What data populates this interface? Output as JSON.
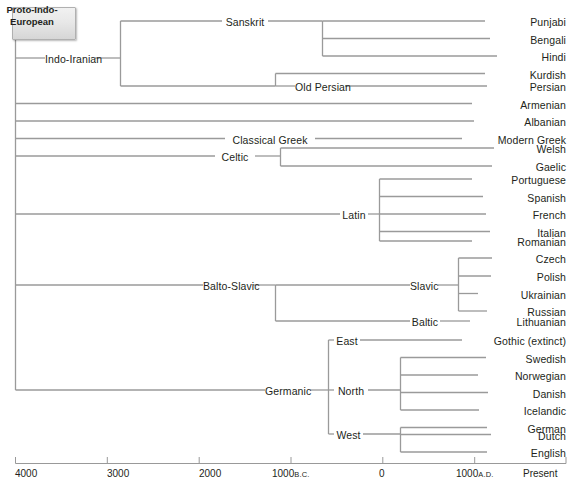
{
  "diagram": {
    "root": {
      "label": "Proto-Indo-European",
      "label_line1": "Proto-Indo-",
      "label_line2": "European"
    },
    "line_color": "#9a9a9a",
    "text_color": "#231f20"
  },
  "nodes": {
    "indo_iranian": "Indo-Iranian",
    "sanskrit": "Sanskrit",
    "old_persian": "Old Persian",
    "punjabi": "Punjabi",
    "bengali": "Bengali",
    "hindi": "Hindi",
    "kurdish": "Kurdish",
    "persian": "Persian",
    "armenian": "Armenian",
    "albanian": "Albanian",
    "classical_greek": "Classical Greek",
    "modern_greek": "Modern Greek",
    "celtic": "Celtic",
    "welsh": "Welsh",
    "gaelic": "Gaelic",
    "latin": "Latin",
    "portuguese": "Portuguese",
    "spanish": "Spanish",
    "french": "French",
    "italian": "Italian",
    "romanian": "Romanian",
    "balto_slavic": "Balto-Slavic",
    "slavic": "Slavic",
    "czech": "Czech",
    "polish": "Polish",
    "ukrainian": "Ukrainian",
    "russian": "Russian",
    "baltic": "Baltic",
    "lithuanian": "Lithuanian",
    "germanic": "Germanic",
    "east": "East",
    "gothic": "Gothic (extinct)",
    "north": "North",
    "swedish": "Swedish",
    "norwegian": "Norwegian",
    "danish": "Danish",
    "icelandic": "Icelandic",
    "west": "West",
    "german": "German",
    "dutch": "Dutch",
    "english": "English"
  },
  "axis": {
    "ticks": [
      {
        "value": "4000",
        "era": ""
      },
      {
        "value": "3000",
        "era": ""
      },
      {
        "value": "2000",
        "era": ""
      },
      {
        "value": "1000",
        "era": "B.C."
      },
      {
        "value": "0",
        "era": ""
      },
      {
        "value": "1000",
        "era": "A.D."
      },
      {
        "value": "Present",
        "era": ""
      }
    ]
  }
}
